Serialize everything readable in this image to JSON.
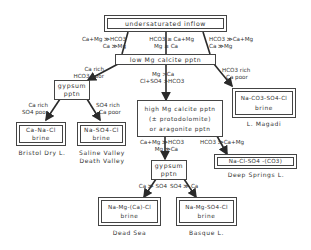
{
  "diagram": {
    "nodes": {
      "inflow": {
        "label": "undersaturated inflow"
      },
      "low_mg_calcite": {
        "label": "low Mg calcite pptn"
      },
      "gypsum_1": {
        "line1": "gypsum",
        "line2": "pptn"
      },
      "high_mg_calcite": {
        "line1": "high Mg calcite pptn",
        "line2": "(± protodolomite)",
        "line3": "or aragonite pptn"
      },
      "gypsum_2": {
        "line1": "gypsum",
        "line2": "pptn"
      },
      "brine_ca_na_cl": {
        "line1": "Ca-Na-Cl",
        "line2": "brine",
        "example": "Bristol Dry L."
      },
      "brine_na_so4_cl": {
        "line1": "Na-SO4-Cl",
        "line2": "brine",
        "example_1": "Saline Valley",
        "example_2": "Death Valley"
      },
      "brine_na_co3_so4_cl": {
        "line1": "Na-CO3-SO4-Cl",
        "line2": "brine",
        "example": "L. Magadi"
      },
      "brine_na_cl_so4_co3": {
        "line1": "Na-Cl-SO4 -(CO3)",
        "example": "Deep Springs L."
      },
      "brine_na_mg_ca_cl": {
        "line1": "Na-Mg-(Ca)-Cl",
        "line2": "brine",
        "example": "Dead Sea"
      },
      "brine_na_mg_so4_cl": {
        "line1": "Na-Mg-SO4-Cl",
        "line2": "brine",
        "example": "Basque L."
      }
    },
    "edges": {
      "inflow_left": {
        "line1": "Ca+Mg ≫HCO3",
        "line2": "Ca ≫Mg"
      },
      "inflow_mid": {
        "line1": "HCO3 ≥ Ca+Mg",
        "line2": "Mg ≥ Ca"
      },
      "inflow_right": {
        "line1": "HCO3 ≫Ca+Mg",
        "line2": "Ca ≫Mg"
      },
      "low_to_gypsum": {
        "line1": "Ca rich",
        "line2": "HCO3 poor"
      },
      "low_to_high": {
        "line1": "Mg    >Ca",
        "line2": "Cl+SO4  >HCO3"
      },
      "low_to_magadi": {
        "line1": "HCO3 rich",
        "line2": "Ca poor"
      },
      "gypsum_left": {
        "line1": "Ca rich",
        "line2": "SO4 poor"
      },
      "gypsum_right": {
        "line1": "SO4 rich",
        "line2": "Ca poor"
      },
      "high_to_gypsum": {
        "line1": "Ca+Mg ≫HCO3",
        "line2": "Mg ≫Ca"
      },
      "high_to_deep": {
        "line1": "HCO3 ≫Ca+Mg"
      },
      "gypsum2_left": {
        "line1": "Ca ≫ SO4"
      },
      "gypsum2_right": {
        "line1": "SO4 ≫ Ca"
      }
    }
  },
  "colors": {
    "line": "#2a2a2a",
    "box_border": "#444444",
    "background": "#ffffff"
  }
}
